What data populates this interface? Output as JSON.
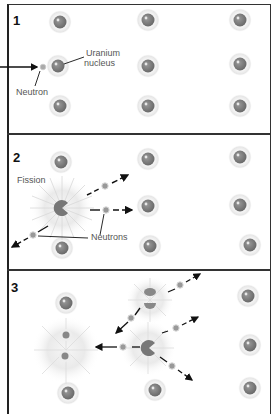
{
  "panels": [
    {
      "number": "1",
      "labels": {
        "nucleus": "Uranium\nnucleus",
        "nucleus_line1": "Uranium",
        "nucleus_line2": "nucleus",
        "neutron": "Neutron"
      }
    },
    {
      "number": "2",
      "labels": {
        "fission": "Fission",
        "neutrons": "Neutrons"
      }
    },
    {
      "number": "3",
      "labels": {}
    }
  ],
  "colors": {
    "nucleus": "#7a7a7a",
    "halo": "#eeeeee",
    "border": "#333333",
    "arrow": "#111111",
    "text": "#555555"
  }
}
